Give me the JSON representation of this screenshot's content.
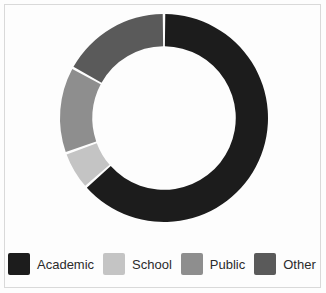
{
  "figure": {
    "background_color": "#fdfdfd",
    "border_color": "#d9d9d9",
    "hole_color": "#fdfdfd",
    "segment_gap_color": "#fdfdfd"
  },
  "chart_data": {
    "type": "pie",
    "variant": "donut",
    "title": "",
    "xlabel": "",
    "ylabel": "",
    "start_angle_deg": 0,
    "direction": "clockwise",
    "hole_fraction": 0.69,
    "legend_position": "bottom",
    "grid": false,
    "categories": [
      "Academic",
      "School",
      "Public",
      "Other"
    ],
    "values": [
      63.5,
      6.0,
      13.5,
      17.0
    ],
    "unit": "percent",
    "colors": [
      "#1c1c1c",
      "#c4c4c4",
      "#8e8e8e",
      "#5a5a5a"
    ],
    "slices": [
      {
        "label": "Academic",
        "value": 63.5,
        "color": "#1c1c1c",
        "start_deg": 0.0,
        "end_deg": 228.6
      },
      {
        "label": "School",
        "value": 6.0,
        "color": "#c4c4c4",
        "start_deg": 228.6,
        "end_deg": 250.2
      },
      {
        "label": "Public",
        "value": 13.5,
        "color": "#8e8e8e",
        "start_deg": 250.2,
        "end_deg": 298.8
      },
      {
        "label": "Other",
        "value": 17.0,
        "color": "#5a5a5a",
        "start_deg": 298.8,
        "end_deg": 360.0
      }
    ]
  },
  "legend": {
    "items": [
      {
        "label": "Academic",
        "color": "#1c1c1c"
      },
      {
        "label": "School",
        "color": "#c4c4c4"
      },
      {
        "label": "Public",
        "color": "#8e8e8e"
      },
      {
        "label": "Other",
        "color": "#5a5a5a"
      }
    ]
  }
}
